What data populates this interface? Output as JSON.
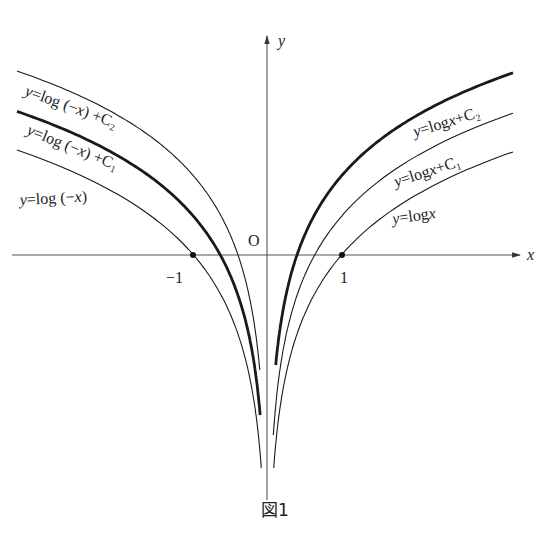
{
  "figure": {
    "caption": "図1",
    "axes": {
      "x_label": "x",
      "y_label": "y",
      "origin_label": "O",
      "tick_labels": [
        "−1",
        "1"
      ]
    },
    "curves_right": [
      {
        "label": "y=logx",
        "style": "thin",
        "constant": 0
      },
      {
        "label": "y=logx+C₁",
        "style": "thin",
        "constant": "C₁"
      },
      {
        "label": "y=logx+C₂",
        "style": "thick",
        "constant": "C₂"
      }
    ],
    "curves_left": [
      {
        "label": "y=log(−x)",
        "style": "thin",
        "constant": 0
      },
      {
        "label": "y=log(−x)+C₁",
        "style": "thick",
        "constant": "C₁"
      },
      {
        "label": "y=log(−x)+C₂",
        "style": "thin",
        "constant": "C₂"
      }
    ],
    "marked_points": [
      "(−1, 0)",
      "(1, 0)"
    ]
  },
  "labels": {
    "r0_y": "y",
    "r0_eq": "=log",
    "r0_x": "x",
    "r1_y": "y",
    "r1_eq": "=log",
    "r1_x": "x",
    "r1_c": "+C₁",
    "r2_y": "y",
    "r2_eq": "=log",
    "r2_x": "x",
    "r2_c": "+C₂",
    "l0_y": "y",
    "l0_eq": "=log (−",
    "l0_x": "x",
    "l0_close": ")",
    "l1_y": "y",
    "l1_eq": "=log (−",
    "l1_x": "x",
    "l1_c": ") +C₁",
    "l2_y": "y",
    "l2_eq": "=log (−",
    "l2_x": "x",
    "l2_c": ") +C₂"
  },
  "chart_data": {
    "type": "line",
    "title": "図1",
    "xlabel": "x",
    "ylabel": "y",
    "xlim": [
      -3.6,
      3.6
    ],
    "ylim": [
      -2.4,
      2.3
    ],
    "grid": false,
    "constants_estimated": {
      "C1": 0.45,
      "C2": 0.92
    },
    "series": [
      {
        "name": "y=logx",
        "domain": "x>0",
        "samples": [
          [
            0.1,
            -2.3
          ],
          [
            0.5,
            -0.69
          ],
          [
            1,
            0
          ],
          [
            2,
            0.69
          ],
          [
            3.3,
            1.19
          ]
        ]
      },
      {
        "name": "y=logx+C₁",
        "domain": "x>0",
        "samples": [
          [
            0.1,
            -1.85
          ],
          [
            0.64,
            0
          ],
          [
            1,
            0.45
          ],
          [
            2,
            1.14
          ],
          [
            3.3,
            1.64
          ]
        ]
      },
      {
        "name": "y=logx+C₂",
        "domain": "x>0",
        "style": "bold",
        "samples": [
          [
            0.1,
            -1.38
          ],
          [
            0.4,
            0
          ],
          [
            1,
            0.92
          ],
          [
            2,
            1.61
          ],
          [
            3.3,
            2.11
          ]
        ]
      },
      {
        "name": "y=log(−x)",
        "domain": "x<0",
        "samples": [
          [
            -3.4,
            1.22
          ],
          [
            -2,
            0.69
          ],
          [
            -1,
            0
          ],
          [
            -0.5,
            -0.69
          ],
          [
            -0.1,
            -2.3
          ]
        ]
      },
      {
        "name": "y=log(−x)+C₁",
        "domain": "x<0",
        "style": "bold",
        "samples": [
          [
            -3.4,
            1.67
          ],
          [
            -1,
            0.45
          ],
          [
            -0.64,
            0
          ],
          [
            -0.1,
            -1.85
          ]
        ]
      },
      {
        "name": "y=log(−x)+C₂",
        "domain": "x<0",
        "samples": [
          [
            -3.4,
            2.14
          ],
          [
            -1,
            0.92
          ],
          [
            -0.4,
            0
          ],
          [
            -0.1,
            -1.38
          ]
        ]
      }
    ],
    "annotations": [
      "O",
      "−1",
      "1",
      "dots at (−1,0) and (1,0)"
    ]
  }
}
